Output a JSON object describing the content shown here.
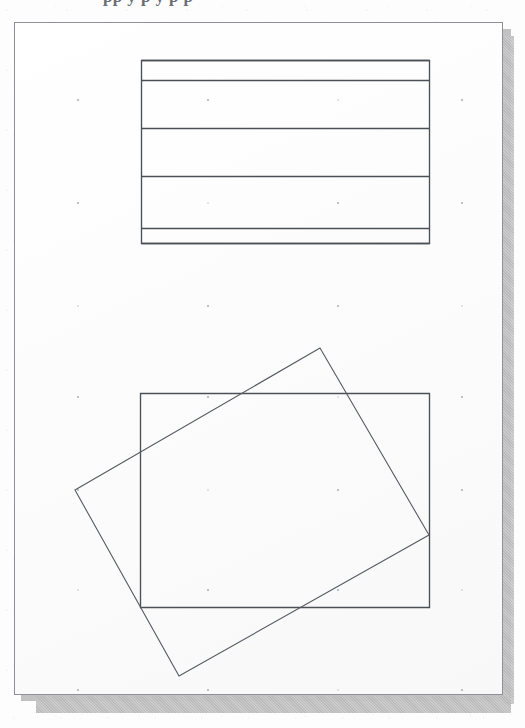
{
  "document": {
    "kind": "scanned-drawing-page",
    "header_cropped_text": "pp y   p y   p p",
    "page_background": "#fefefe",
    "page_border_color": "#8e9096",
    "shadow_color": "#b4b4b4",
    "ink_color": "#4c4f55",
    "grid_dot_color": "#9aa0a8"
  },
  "bleed_text": [
    {
      "id": "bleed-1",
      "text": "Box of lines and band figure",
      "x": 52,
      "y": 36,
      "size": 15,
      "rotate": -0.4
    },
    {
      "id": "bleed-2",
      "text": "A rectangle divided",
      "x": 208,
      "y": 126,
      "size": 13,
      "rotate": 0
    },
    {
      "id": "bleed-3",
      "text": "rotated over",
      "x": 150,
      "y": 372,
      "size": 14,
      "rotate": -0.6
    },
    {
      "id": "bleed-4",
      "text": "an offset copy",
      "x": 250,
      "y": 432,
      "size": 13,
      "rotate": 0
    },
    {
      "id": "bleed-5",
      "text": "overlapping outline",
      "x": 198,
      "y": 664,
      "size": 13,
      "rotate": 0
    },
    {
      "id": "bleed-6",
      "text": "figure",
      "x": 372,
      "y": 600,
      "size": 13,
      "rotate": 0
    }
  ],
  "figures": [
    {
      "id": "banded-rectangle",
      "name": "banded-rectangle-figure",
      "type": "rectangle-with-horizontal-divisions",
      "x": 141,
      "y": 60,
      "width": 288,
      "height": 183,
      "division_y": [
        60,
        80,
        128,
        176,
        228,
        243
      ],
      "band_count": 5,
      "stroke": "#4c4f55",
      "stroke_width": 1.6
    },
    {
      "id": "axis-aligned-rectangle",
      "name": "axis-aligned-rectangle-figure",
      "type": "rectangle",
      "x": 140,
      "y": 393,
      "width": 289,
      "height": 214,
      "stroke": "#4c4f55",
      "stroke_width": 1.35
    },
    {
      "id": "rotated-rectangle",
      "name": "rotated-rectangle-figure",
      "type": "polygon",
      "points": [
        [
          320,
          348
        ],
        [
          429,
          535
        ],
        [
          179,
          676
        ],
        [
          75,
          490
        ]
      ],
      "approx_rotation_deg": -17,
      "stroke": "#565a61",
      "stroke_width": 1.1
    }
  ],
  "grid": {
    "name": "dot-grid",
    "spacing_x": 130,
    "spacing_y": 103,
    "origin_x": 76,
    "origin_y": 98,
    "columns": 4,
    "rows": 6,
    "dots": [
      [
        76,
        98
      ],
      [
        206,
        98
      ],
      [
        336,
        98
      ],
      [
        460,
        98
      ],
      [
        76,
        201
      ],
      [
        206,
        201
      ],
      [
        336,
        201
      ],
      [
        460,
        201
      ],
      [
        76,
        304
      ],
      [
        206,
        304
      ],
      [
        336,
        304
      ],
      [
        460,
        304
      ],
      [
        76,
        395
      ],
      [
        206,
        395
      ],
      [
        336,
        395
      ],
      [
        460,
        395
      ],
      [
        76,
        488
      ],
      [
        206,
        488
      ],
      [
        336,
        488
      ],
      [
        460,
        488
      ],
      [
        76,
        588
      ],
      [
        206,
        588
      ],
      [
        336,
        588
      ],
      [
        460,
        588
      ],
      [
        76,
        688
      ],
      [
        206,
        688
      ],
      [
        336,
        688
      ],
      [
        460,
        688
      ]
    ]
  },
  "page_rect": {
    "x": 14,
    "y": 22,
    "width": 489,
    "height": 673
  },
  "canvas": {
    "width": 525,
    "height": 728
  }
}
